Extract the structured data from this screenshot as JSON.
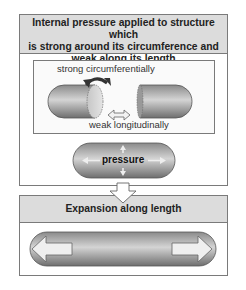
{
  "panel1": {
    "title_lines": [
      "Internal pressure applied to structure which",
      "is strong around its circumference and",
      "weak along its length"
    ],
    "label_strong": "strong circumferentially",
    "label_weak": "weak longitudinally",
    "label_pressure": "pressure"
  },
  "panel2": {
    "title": "Expansion along length"
  },
  "colors": {
    "header_bg": "#dcdcdc",
    "border": "#7a7a7a",
    "capsule_dark": "#7d7d7d",
    "capsule_light": "#d2d2d2",
    "arrow_fill": "#efefef"
  }
}
